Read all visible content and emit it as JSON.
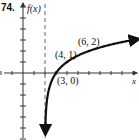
{
  "problem_number": "74.",
  "chart_data": {
    "type": "line",
    "title": "",
    "function": "f(x) = log_2(x - 2)",
    "ylabel": "f(x)",
    "xlabel": "x",
    "asymptote": {
      "type": "vertical",
      "x": 2,
      "style": "dashed"
    },
    "points": [
      {
        "x": 3,
        "y": 0,
        "label": "(3, 0)"
      },
      {
        "x": 4,
        "y": 1,
        "label": "(4, 1)"
      },
      {
        "x": 6,
        "y": 2,
        "label": "(6, 2)"
      }
    ],
    "series": [
      {
        "name": "f(x)",
        "x": [
          2.03,
          2.1,
          2.25,
          2.5,
          3,
          4,
          6,
          8,
          10
        ],
        "values": [
          -5.06,
          -3.32,
          -2.0,
          -1.0,
          0,
          1,
          2,
          2.58,
          3
        ]
      }
    ],
    "xlim": [
      -2,
      10
    ],
    "ylim": [
      -6,
      6
    ],
    "grid": false,
    "legend": "none",
    "colors": {
      "curve": "#111111",
      "axis": "#333333",
      "asymptote": "#666666"
    }
  }
}
